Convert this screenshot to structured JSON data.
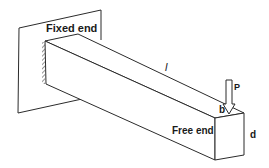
{
  "diagram": {
    "labels": {
      "fixed_end": "Fixed end",
      "free_end": "Free end",
      "length": "l",
      "load": "P",
      "width": "b",
      "depth": "d"
    },
    "colors": {
      "stroke": "#2b2b2b",
      "background": "#ffffff",
      "text": "#1a1a1a"
    }
  }
}
